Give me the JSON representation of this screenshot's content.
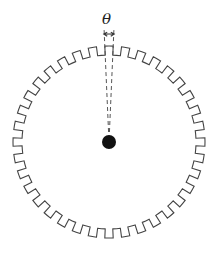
{
  "diagram": {
    "type": "encoder-wheel",
    "angle_label": "θ",
    "teeth_count": 36,
    "center": [
      109,
      142
    ],
    "outer_radius": 96,
    "inner_radius": 87,
    "hub_radius": 7,
    "colors": {
      "stroke": "#444444",
      "hub": "#111111",
      "background": "#ffffff"
    }
  }
}
